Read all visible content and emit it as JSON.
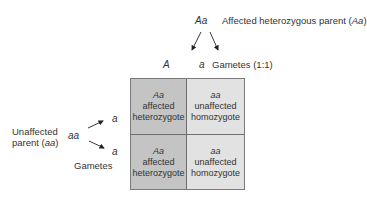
{
  "top_parent": {
    "genotype": "Aa",
    "label_prefix": "Affected heterozygous parent (",
    "label_genotype": "Aa",
    "label_suffix": ")"
  },
  "top_gametes": {
    "allele_1": "A",
    "allele_2": "a",
    "label": "Gametes (1:1)"
  },
  "left_parent": {
    "label_line1": "Unaffected",
    "label_line2_prefix": "parent (",
    "label_line2_genotype": "aa",
    "label_line2_suffix": ")",
    "genotype": "aa"
  },
  "left_gametes": {
    "allele_1": "a",
    "allele_2": "a",
    "label": "Gametes"
  },
  "punnett": {
    "cells": [
      {
        "genotype": "Aa",
        "line1": "affected",
        "line2": "heterozygote",
        "fill": "#c4c4c4"
      },
      {
        "genotype": "aa",
        "line1": "unaffected",
        "line2": "homozygote",
        "fill": "#e2e2e2"
      },
      {
        "genotype": "Aa",
        "line1": "affected",
        "line2": "heterozygote",
        "fill": "#c4c4c4"
      },
      {
        "genotype": "aa",
        "line1": "unaffected",
        "line2": "homozygote",
        "fill": "#e2e2e2"
      }
    ]
  }
}
